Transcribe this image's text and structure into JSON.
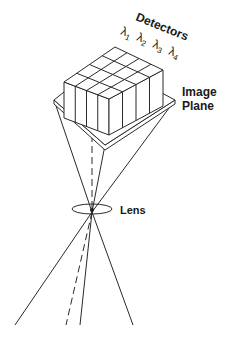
{
  "diagram": {
    "labels": {
      "detectors": "Detectors",
      "image_plane_line1": "Image",
      "image_plane_line2": "Plane",
      "lens": "Lens"
    },
    "wavelengths": [
      {
        "symbol": "λ",
        "subscript": "1"
      },
      {
        "symbol": "λ",
        "subscript": "2"
      },
      {
        "symbol": "λ",
        "subscript": "3"
      },
      {
        "symbol": "λ",
        "subscript": "4"
      }
    ],
    "detector_grid": {
      "columns": 4,
      "rows": 4
    },
    "colors": {
      "line": "#2a2a2a",
      "background": "#ffffff",
      "text": "#1a1a1a"
    }
  }
}
